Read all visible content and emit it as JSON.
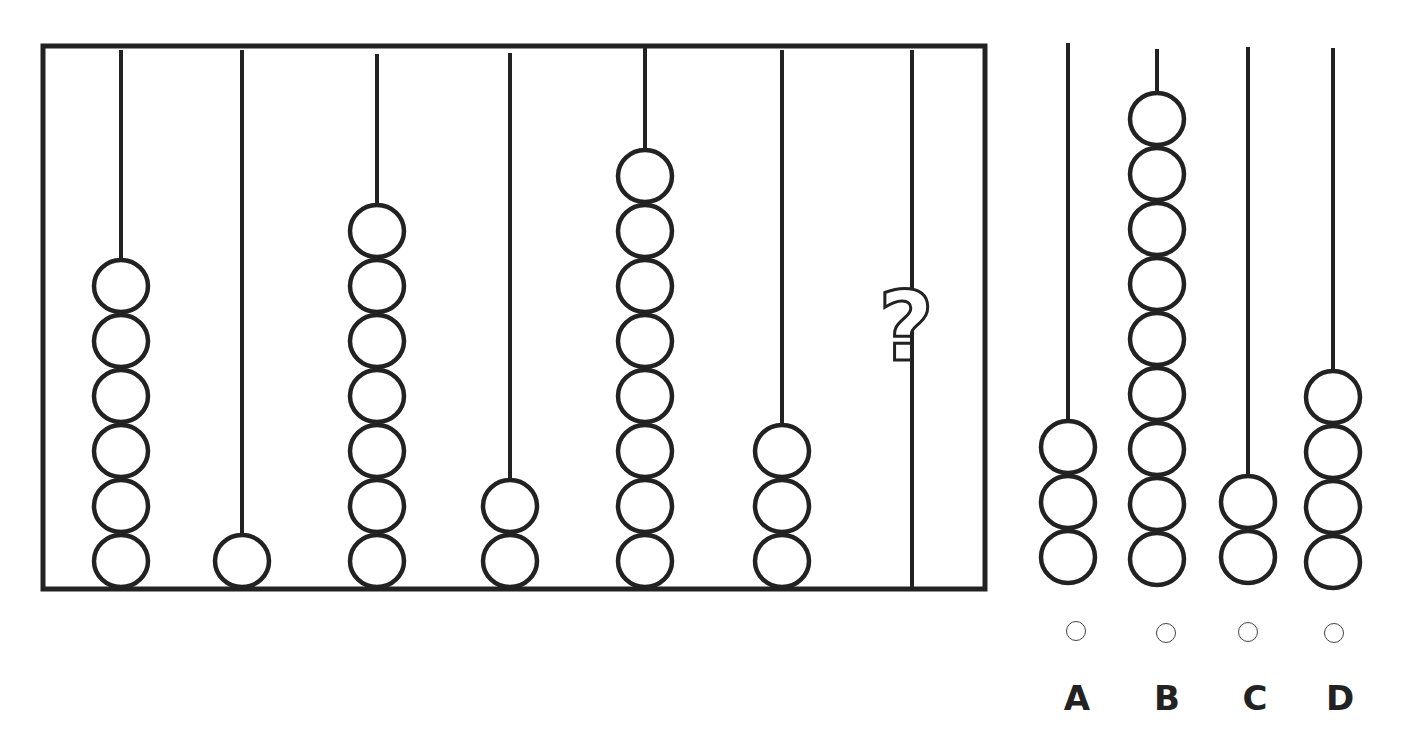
{
  "puzzle": {
    "type": "abacus-sequence",
    "frame_rods": [
      {
        "beads": 6,
        "x": 121,
        "top": 50
      },
      {
        "beads": 1,
        "x": 242,
        "top": 50
      },
      {
        "beads": 7,
        "x": 377,
        "top": 54
      },
      {
        "beads": 2,
        "x": 510,
        "top": 53
      },
      {
        "beads": 8,
        "x": 645,
        "top": 48
      },
      {
        "beads": 3,
        "x": 782,
        "top": 50
      },
      {
        "beads": null,
        "x": 912,
        "top": 50,
        "marker": "?"
      }
    ],
    "question_mark": "?",
    "options": [
      {
        "label": "A",
        "beads": 3,
        "x": 1068,
        "top": 43
      },
      {
        "label": "B",
        "beads": 9,
        "x": 1157,
        "top": 49
      },
      {
        "label": "C",
        "beads": 2,
        "x": 1248,
        "top": 47
      },
      {
        "label": "D",
        "beads": 4,
        "x": 1333,
        "top": 48
      }
    ]
  }
}
